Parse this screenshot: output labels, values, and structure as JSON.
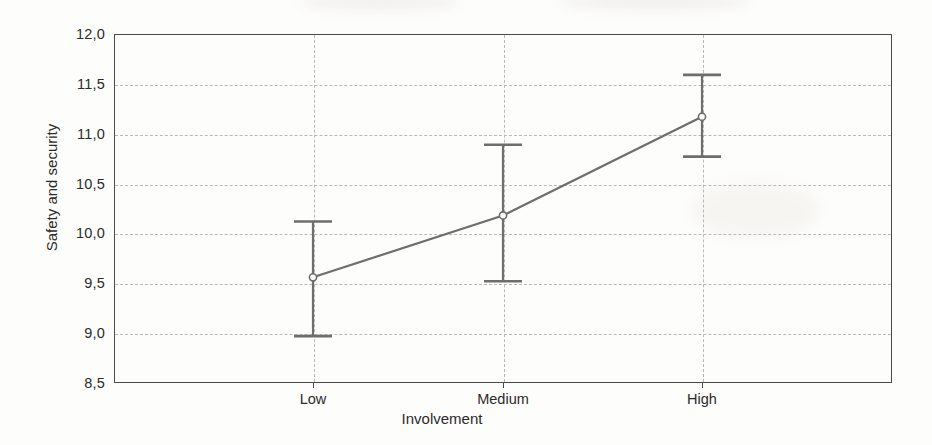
{
  "chart_data": {
    "type": "line",
    "title": "",
    "subtitle": "",
    "xlabel": "Involvement",
    "ylabel": "Safety and security",
    "categories": [
      "Low",
      "Medium",
      "High"
    ],
    "values": [
      9.56,
      10.18,
      11.17
    ],
    "error_bars": {
      "type": "confidence-interval",
      "lower": [
        8.97,
        9.52,
        10.77
      ],
      "upper": [
        10.12,
        10.89,
        11.59
      ]
    },
    "series": [
      {
        "name": "Safety and security",
        "values": [
          9.56,
          10.18,
          11.17
        ],
        "lower": [
          8.97,
          9.52,
          10.77
        ],
        "upper": [
          10.12,
          10.89,
          11.59
        ]
      }
    ],
    "ylim": [
      8.5,
      12.0
    ],
    "ytick_labels": [
      "12,0",
      "11,5",
      "11,0",
      "10,5",
      "10,0",
      "9,5",
      "9,0",
      "8,5"
    ],
    "ytick_values": [
      12.0,
      11.5,
      11.0,
      10.5,
      10.0,
      9.5,
      9.0,
      8.5
    ],
    "xtick_labels": [
      "Low",
      "Medium",
      "High"
    ],
    "grid": true,
    "grid_style": "dashed",
    "legend": "none",
    "marker": "open-circle",
    "line_color": "#6e6e6e",
    "grid_color": "#b9b9b9",
    "axis_color": "#4a4a4a",
    "text_color": "#2b2b2b",
    "background_color": "#fdfdfb"
  }
}
